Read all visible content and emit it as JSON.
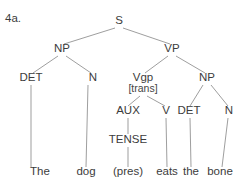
{
  "figure": {
    "item_number": "4a.",
    "clipped_header_text": "·  ·  ·",
    "sentence": "The dog eats the bone",
    "width": 247,
    "height": 189,
    "background_color": "#ffffff",
    "line_color": "#8d8d8d",
    "text_color": "#3c3c3c"
  },
  "nodes": {
    "s": {
      "label": "S",
      "x": 119,
      "y": 24
    },
    "np_subject": {
      "label": "NP",
      "x": 62,
      "y": 52
    },
    "vp": {
      "label": "VP",
      "x": 172,
      "y": 52
    },
    "det_subject": {
      "label": "DET",
      "x": 31,
      "y": 81
    },
    "n_subject": {
      "label": "N",
      "x": 93,
      "y": 81
    },
    "vgp": {
      "label": "Vgp",
      "x": 143,
      "y": 81
    },
    "vgp_feature": {
      "label": "[trans]",
      "x": 143,
      "y": 92
    },
    "np_object": {
      "label": "NP",
      "x": 207,
      "y": 81
    },
    "aux": {
      "label": "AUX",
      "x": 128,
      "y": 114
    },
    "v": {
      "label": "V",
      "x": 166,
      "y": 114
    },
    "det_object": {
      "label": "DET",
      "x": 189,
      "y": 114
    },
    "n_object": {
      "label": "N",
      "x": 229,
      "y": 114
    },
    "tense": {
      "label": "TENSE",
      "x": 128,
      "y": 143
    }
  },
  "terminals": [
    {
      "id": "terminal-the",
      "label": "The",
      "x": 40,
      "y": 175
    },
    {
      "id": "terminal-dog",
      "label": "dog",
      "x": 86,
      "y": 175
    },
    {
      "id": "terminal-pres",
      "label": "(pres)",
      "x": 128,
      "y": 175
    },
    {
      "id": "terminal-eats",
      "label": "eats",
      "x": 167,
      "y": 175
    },
    {
      "id": "terminal-the2",
      "label": "the",
      "x": 191,
      "y": 175
    },
    {
      "id": "terminal-bone",
      "label": "bone",
      "x": 220,
      "y": 175
    }
  ],
  "edges": [
    {
      "id": "edge-s-np",
      "from": "S",
      "to": "NP (subject)",
      "x1": 115,
      "y1": 28,
      "x2": 64,
      "y2": 44
    },
    {
      "id": "edge-s-vp",
      "from": "S",
      "to": "VP",
      "x1": 123,
      "y1": 28,
      "x2": 170,
      "y2": 44
    },
    {
      "id": "edge-np-det",
      "from": "NP (subject)",
      "to": "DET",
      "x1": 58,
      "y1": 56,
      "x2": 33,
      "y2": 73
    },
    {
      "id": "edge-np-n",
      "from": "NP (subject)",
      "to": "N",
      "x1": 66,
      "y1": 56,
      "x2": 91,
      "y2": 73
    },
    {
      "id": "edge-vp-vgp",
      "from": "VP",
      "to": "Vgp",
      "x1": 168,
      "y1": 56,
      "x2": 145,
      "y2": 73
    },
    {
      "id": "edge-vp-np",
      "from": "VP",
      "to": "NP (object)",
      "x1": 176,
      "y1": 56,
      "x2": 205,
      "y2": 73
    },
    {
      "id": "edge-det-the",
      "from": "DET",
      "to": "The",
      "x1": 31,
      "y1": 85,
      "x2": 31,
      "y2": 167
    },
    {
      "id": "edge-n-dog",
      "from": "N",
      "to": "dog",
      "x1": 88,
      "y1": 85,
      "x2": 86,
      "y2": 167
    },
    {
      "id": "edge-vgp-aux",
      "from": "Vgp",
      "to": "AUX",
      "x1": 140,
      "y1": 96,
      "x2": 128,
      "y2": 106
    },
    {
      "id": "edge-vgp-v",
      "from": "Vgp",
      "to": "V",
      "x1": 147,
      "y1": 96,
      "x2": 165,
      "y2": 106
    },
    {
      "id": "edge-npobj-det",
      "from": "NP (object)",
      "to": "DET",
      "x1": 203,
      "y1": 85,
      "x2": 190,
      "y2": 106
    },
    {
      "id": "edge-npobj-n",
      "from": "NP (object)",
      "to": "N",
      "x1": 211,
      "y1": 85,
      "x2": 228,
      "y2": 106
    },
    {
      "id": "edge-aux-tense",
      "from": "AUX",
      "to": "TENSE",
      "x1": 128,
      "y1": 118,
      "x2": 128,
      "y2": 134
    },
    {
      "id": "edge-tense-pres",
      "from": "TENSE",
      "to": "(pres)",
      "x1": 128,
      "y1": 147,
      "x2": 128,
      "y2": 167
    },
    {
      "id": "edge-v-eats",
      "from": "V",
      "to": "eats",
      "x1": 166,
      "y1": 118,
      "x2": 167,
      "y2": 167
    },
    {
      "id": "edge-detobj-the",
      "from": "DET",
      "to": "the",
      "x1": 190,
      "y1": 118,
      "x2": 191,
      "y2": 167
    },
    {
      "id": "edge-nobj-bone",
      "from": "N",
      "to": "bone",
      "x1": 228,
      "y1": 118,
      "x2": 222,
      "y2": 167
    }
  ]
}
